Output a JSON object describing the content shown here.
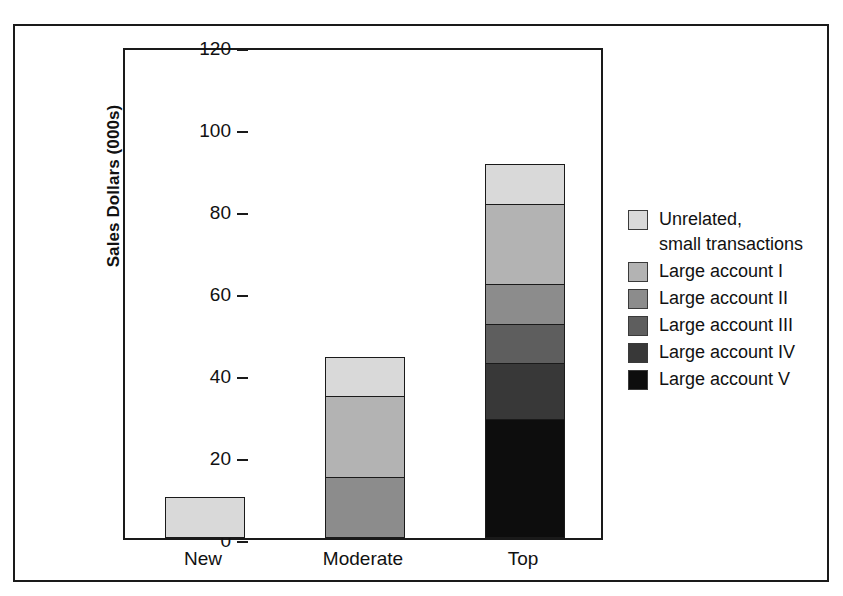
{
  "chart_data": {
    "type": "bar",
    "subtype": "stacked-bar",
    "title": "",
    "xlabel": "",
    "ylabel": "Sales Dollars (000s)",
    "ylim": [
      0,
      120
    ],
    "yticks": [
      0,
      20,
      40,
      60,
      80,
      100,
      120
    ],
    "ytick_labels": [
      "0",
      "20",
      "40",
      "60",
      "80",
      "100",
      "120"
    ],
    "grid": false,
    "legend_position": "right",
    "categories": [
      "New",
      "Moderate",
      "Top"
    ],
    "series": [
      {
        "name": "Unrelated,\nsmall transactions",
        "color": "#d9d9d9",
        "values": [
          10,
          10,
          10
        ]
      },
      {
        "name": "Large account I",
        "color": "#b3b3b3",
        "values": [
          0,
          20,
          20
        ]
      },
      {
        "name": "Large account II",
        "color": "#8c8c8c",
        "values": [
          0,
          15,
          10
        ]
      },
      {
        "name": "Large account III",
        "color": "#5e5e5e",
        "values": [
          0,
          0,
          10
        ]
      },
      {
        "name": "Large account IV",
        "color": "#383838",
        "values": [
          0,
          0,
          14
        ]
      },
      {
        "name": "Large account V",
        "color": "#0d0d0d",
        "values": [
          0,
          0,
          29
        ]
      }
    ],
    "totals": [
      10,
      45,
      93
    ],
    "stack_order_bottom_to_top": [
      "Large account V",
      "Large account IV",
      "Large account III",
      "Large account II",
      "Large account I",
      "Unrelated,\nsmall transactions"
    ],
    "bar_segments": {
      "New": [
        {
          "series": "Unrelated,\nsmall transactions",
          "from": 0,
          "to": 10
        }
      ],
      "Moderate": [
        {
          "series": "Large account II",
          "from": 0,
          "to": 15
        },
        {
          "series": "Large account I",
          "from": 15,
          "to": 35
        },
        {
          "series": "Unrelated,\nsmall transactions",
          "from": 35,
          "to": 45
        }
      ],
      "Top": [
        {
          "series": "Large account V",
          "from": 0,
          "to": 29
        },
        {
          "series": "Large account IV",
          "from": 29,
          "to": 43
        },
        {
          "series": "Large account III",
          "from": 43,
          "to": 53
        },
        {
          "series": "Large account II",
          "from": 53,
          "to": 63
        },
        {
          "series": "Large account I",
          "from": 63,
          "to": 83
        },
        {
          "series": "Unrelated,\nsmall transactions",
          "from": 83,
          "to": 93
        }
      ]
    }
  },
  "legend": {
    "items": [
      {
        "label": "Unrelated,\nsmall transactions",
        "color": "#d9d9d9"
      },
      {
        "label": "Large account I",
        "color": "#b3b3b3"
      },
      {
        "label": "Large account II",
        "color": "#8c8c8c"
      },
      {
        "label": "Large account III",
        "color": "#5e5e5e"
      },
      {
        "label": "Large account IV",
        "color": "#383838"
      },
      {
        "label": "Large account V",
        "color": "#0d0d0d"
      }
    ]
  },
  "colors": {
    "axis": "#1a1a1a",
    "text": "#111111",
    "background": "#ffffff"
  }
}
